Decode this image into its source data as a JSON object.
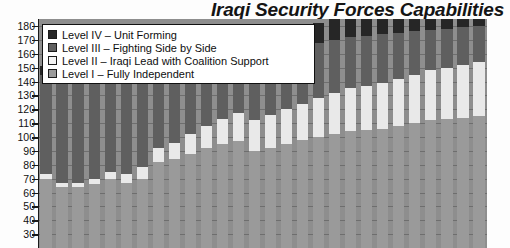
{
  "chart_data": {
    "type": "bar",
    "subtype": "stacked-bar",
    "title": "Iraqi Security Forces Capabilities",
    "xlabel": "",
    "ylabel": "",
    "ylim": [
      20,
      185
    ],
    "yticks": [
      180,
      170,
      160,
      150,
      140,
      130,
      120,
      110,
      100,
      90,
      80,
      70,
      60,
      50,
      40,
      30
    ],
    "grid": true,
    "legend_position": "top-left",
    "categories": [
      "1",
      "2",
      "3",
      "4",
      "5",
      "6",
      "7",
      "8",
      "9",
      "10",
      "11",
      "12",
      "13",
      "14",
      "15",
      "16",
      "17",
      "18",
      "19",
      "20",
      "21",
      "22",
      "23",
      "24",
      "25",
      "26",
      "27",
      "28"
    ],
    "series": [
      {
        "name": "Level I  – Fully Independent",
        "color": "#9a9a9a",
        "values": [
          50,
          44,
          44,
          46,
          50,
          47,
          50,
          62,
          64,
          68,
          72,
          75,
          77,
          70,
          72,
          75,
          78,
          80,
          82,
          84,
          85,
          86,
          88,
          90,
          92,
          93,
          94,
          95
        ]
      },
      {
        "name": "Level II  – Iraqi Lead with Coalition Support",
        "color": "#e9e9e9",
        "values": [
          3,
          3,
          3,
          4,
          5,
          6,
          8,
          10,
          12,
          14,
          16,
          18,
          20,
          22,
          24,
          25,
          26,
          28,
          30,
          31,
          32,
          33,
          34,
          35,
          36,
          37,
          38,
          39
        ]
      },
      {
        "name": "Level III  – Fighting Side by Side",
        "color": "#5f5f5f",
        "values": [
          72,
          76,
          76,
          78,
          80,
          81,
          80,
          62,
          60,
          56,
          52,
          49,
          46,
          48,
          46,
          44,
          42,
          40,
          38,
          37,
          36,
          35,
          33,
          31,
          29,
          28,
          27,
          26
        ]
      },
      {
        "name": "Level IV  – Unit Forming",
        "color": "#262626",
        "values": [
          6,
          6,
          6,
          8,
          9,
          9,
          9,
          10,
          11,
          11,
          12,
          12,
          12,
          13,
          13,
          14,
          14,
          14,
          15,
          15,
          15,
          15,
          15,
          15,
          15,
          15,
          15,
          15
        ]
      }
    ],
    "totals": [
      131,
      129,
      129,
      136,
      144,
      143,
      147,
      144,
      147,
      149,
      152,
      154,
      155,
      153,
      155,
      158,
      160,
      162,
      165,
      167,
      168,
      169,
      170,
      171,
      172,
      173,
      174,
      175
    ]
  },
  "legend": {
    "items": [
      {
        "label": "Level IV  – Unit Forming",
        "color": "#262626"
      },
      {
        "label": "Level III – Fighting Side by Side",
        "color": "#5f5f5f"
      },
      {
        "label": "Level II  – Iraqi Lead with Coalition Support",
        "color": "#f4f4f4"
      },
      {
        "label": "Level I   – Fully Independent",
        "color": "#9a9a9a"
      }
    ]
  }
}
